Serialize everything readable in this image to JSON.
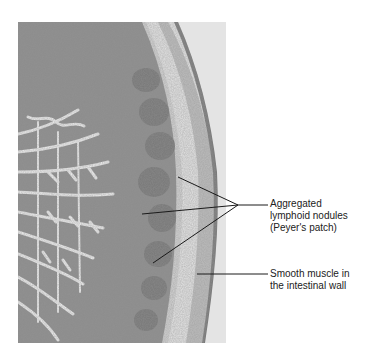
{
  "figure": {
    "type": "histology micrograph"
  },
  "labels": [
    {
      "id": "peyers-patch",
      "lines": [
        "Aggregated",
        "lymphoid nodules",
        "(Peyer's patch)"
      ],
      "pointer_count": 3
    },
    {
      "id": "smooth-muscle",
      "lines": [
        "Smooth muscle in",
        "the intestinal wall"
      ],
      "pointer_count": 1
    }
  ]
}
